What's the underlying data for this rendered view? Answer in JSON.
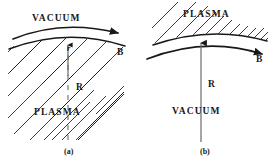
{
  "figure": {
    "background_color": "#ffffff",
    "ink_color": "#181818",
    "panels": [
      {
        "id": "a",
        "caption": "(a)",
        "region_outside_label": "VACUUM",
        "region_hatched_label": "PLASMA",
        "field_label": "B",
        "radius_label": "R",
        "radius_small_label": "r",
        "hatch_side": "below-curve",
        "curvature": "convex-up",
        "field_arrow_direction": "right",
        "radius_line_style": "dashed",
        "radius_arrow_direction": "up"
      },
      {
        "id": "b",
        "caption": "(b)",
        "region_outside_label": "VACUUM",
        "region_hatched_label": "PLASMA",
        "field_label": "B",
        "radius_label": "R",
        "hatch_side": "above-curve",
        "curvature": "convex-up",
        "field_arrow_direction": "right",
        "radius_line_style": "solid",
        "radius_arrow_direction": "up"
      }
    ]
  }
}
